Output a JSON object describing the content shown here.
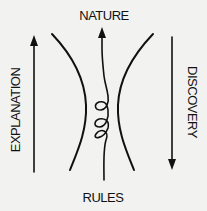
{
  "diagram": {
    "labels": {
      "top": "NATURE",
      "bottom": "RULES",
      "left": "EXPLANATION",
      "right": "DISCOVERY"
    },
    "arrows": {
      "left": {
        "label_ref": "EXPLANATION",
        "direction": "up"
      },
      "right": {
        "label_ref": "DISCOVERY",
        "direction": "down"
      },
      "center": {
        "from": "RULES",
        "to": "NATURE",
        "direction": "up",
        "style": "looped-spiral",
        "loop_count": 3
      }
    },
    "colors": {
      "background": "#f2f2f0",
      "ink": "#111111"
    }
  }
}
